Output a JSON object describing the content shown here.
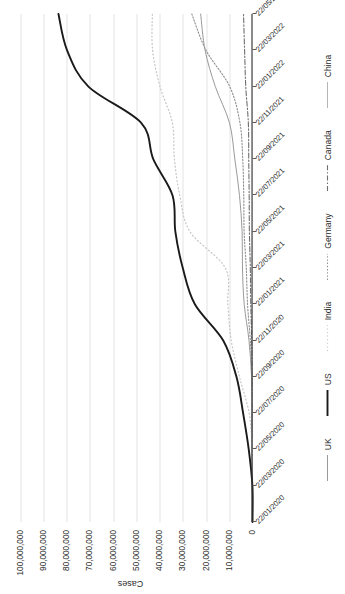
{
  "chart_data": {
    "type": "line",
    "title": "",
    "xlabel": "",
    "ylabel": "Cases",
    "ylim": [
      0,
      105000000
    ],
    "grid": true,
    "grid_axis": "y",
    "legend_position": "bottom",
    "orientation_note": "figure rendered rotated 90 degrees counter-clockwise in screenshot",
    "y_ticks": [
      "0",
      "10,000,000",
      "20,000,000",
      "30,000,000",
      "40,000,000",
      "50,000,000",
      "60,000,000",
      "70,000,000",
      "80,000,000",
      "90,000,000",
      "100,000,000"
    ],
    "y_tick_values": [
      0,
      10000000,
      20000000,
      30000000,
      40000000,
      50000000,
      60000000,
      70000000,
      80000000,
      90000000,
      100000000
    ],
    "categories": [
      "22/01/2020",
      "22/03/2020",
      "22/05/2020",
      "22/07/2020",
      "22/09/2020",
      "22/11/2020",
      "22/01/2021",
      "22/03/2021",
      "22/05/2021",
      "22/07/2021",
      "22/09/2021",
      "22/11/2021",
      "22/01/2022",
      "22/03/2022",
      "22/05/2022"
    ],
    "series": [
      {
        "name": "UK",
        "style": "solid-thin",
        "color": "#9a9a9a",
        "values": [
          0,
          5000,
          255000,
          298000,
          410000,
          1500000,
          3560000,
          4320000,
          4470000,
          5600000,
          7600000,
          9900000,
          16000000,
          20400000,
          22300000
        ]
      },
      {
        "name": "US",
        "style": "solid-thick",
        "color": "#1a1a1a",
        "values": [
          0,
          44000,
          1620000,
          4040000,
          6900000,
          12600000,
          24800000,
          30000000,
          33200000,
          34400000,
          42700000,
          47900000,
          70600000,
          79800000,
          83500000
        ]
      },
      {
        "name": "India",
        "style": "dotted-fine",
        "color": "#c4c4c4",
        "values": [
          0,
          500,
          125000,
          1440000,
          5600000,
          9140000,
          10600000,
          11700000,
          26900000,
          31300000,
          33600000,
          34500000,
          39800000,
          43000000,
          43100000
        ]
      },
      {
        "name": "Germany",
        "style": "dotted",
        "color": "#8f8f8f",
        "values": [
          0,
          23000,
          179000,
          204000,
          276000,
          929000,
          2130000,
          2680000,
          3600000,
          3760000,
          4200000,
          5400000,
          9800000,
          20000000,
          26100000
        ]
      },
      {
        "name": "Canada",
        "style": "dash-dot",
        "color": "#6f6f6f",
        "values": [
          0,
          2000,
          83000,
          112000,
          145000,
          330000,
          740000,
          940000,
          1340000,
          1430000,
          1620000,
          1790000,
          2900000,
          3400000,
          3870000
        ]
      },
      {
        "name": "China",
        "style": "solid-light",
        "color": "#b5b5b5",
        "values": [
          0,
          81500,
          84000,
          86000,
          90000,
          92000,
          99000,
          102000,
          103000,
          106000,
          108000,
          112000,
          130000,
          200000,
          224000
        ]
      }
    ],
    "legend": [
      "UK",
      "US",
      "India",
      "Germany",
      "Canada",
      "China"
    ]
  }
}
